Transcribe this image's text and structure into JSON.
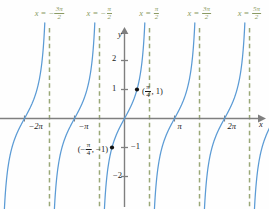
{
  "chart_data": {
    "type": "line",
    "title": "",
    "function": "y = tan x",
    "xlabel": "x",
    "ylabel": "y",
    "xlim": [
      -7.2,
      8.6
    ],
    "ylim": [
      -2.9,
      2.9
    ],
    "grid": false,
    "legend": null,
    "x_ticks": [
      {
        "value": -6.2832,
        "label": "−2π"
      },
      {
        "value": -3.1416,
        "label": "−π"
      },
      {
        "value": 3.1416,
        "label": "π"
      },
      {
        "value": 6.2832,
        "label": "2π"
      }
    ],
    "y_ticks": [
      {
        "value": 2,
        "label": "2"
      },
      {
        "value": 1,
        "label": "1"
      },
      {
        "value": -1,
        "label": "−1"
      },
      {
        "value": -2,
        "label": "−2"
      }
    ],
    "asymptotes": [
      {
        "value": -4.7124,
        "eq_lhs": "x",
        "eq_rel": "=",
        "sign": "−",
        "num": "3π",
        "den": "2"
      },
      {
        "value": -1.5708,
        "eq_lhs": "x",
        "eq_rel": "=",
        "sign": "−",
        "num": "π",
        "den": "2"
      },
      {
        "value": 1.5708,
        "eq_lhs": "x",
        "eq_rel": "=",
        "sign": "",
        "num": "π",
        "den": "2"
      },
      {
        "value": 4.7124,
        "eq_lhs": "x",
        "eq_rel": "=",
        "sign": "",
        "num": "3π",
        "den": "2"
      },
      {
        "value": 7.854,
        "eq_lhs": "x",
        "eq_rel": "=",
        "sign": "",
        "num": "5π",
        "den": "2"
      }
    ],
    "points": [
      {
        "x": 0.7854,
        "y": 1,
        "open_paren": "(",
        "num": "π",
        "den": "4",
        "sign": "",
        "sep": ",",
        "yval": "1",
        "close_paren": ")"
      },
      {
        "x": -0.7854,
        "y": -1,
        "open_paren": "(",
        "num": "π",
        "den": "4",
        "sign": "−",
        "sep": ",",
        "yval": "−1",
        "close_paren": ")"
      }
    ],
    "colors": {
      "curve": "#5b9bd5",
      "asymptote": "#9aa877",
      "axis": "#7f7f7f",
      "text": "#1a1a1a",
      "asymptote_text": "#8a9a63",
      "background": "#fefefe"
    }
  }
}
